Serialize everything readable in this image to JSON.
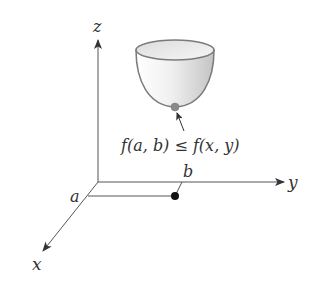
{
  "figure": {
    "axes": {
      "x_label": "x",
      "y_label": "y",
      "z_label": "z"
    },
    "point_labels": {
      "a": "a",
      "b": "b"
    },
    "annotation": "f(a, b) ≤ f(x, y)",
    "colors": {
      "axis": "#444444",
      "surface_fill_light": "#f4f4f4",
      "surface_fill_dark": "#c8c8c8",
      "surface_edge": "#7a7a7a",
      "min_point": "#8a8a8a",
      "base_point": "#111111"
    }
  }
}
